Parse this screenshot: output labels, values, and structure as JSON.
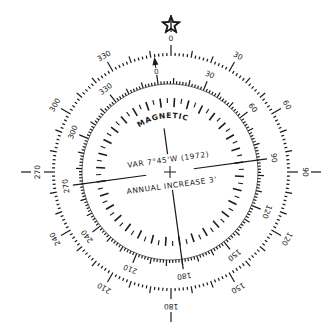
{
  "figure": {
    "colors": {
      "ink": "#1a1a1a",
      "background": "#ffffff"
    }
  },
  "true_ring": {
    "label": "True",
    "north_symbol": "star-icon",
    "center": [
      171,
      172
    ],
    "radius": 116,
    "labels": [
      "0",
      "30",
      "60",
      "90",
      "120",
      "150",
      "180",
      "210",
      "240",
      "270",
      "300",
      "330"
    ],
    "label_degrees": [
      0,
      30,
      60,
      90,
      120,
      150,
      180,
      210,
      240,
      270,
      300,
      330
    ]
  },
  "magnetic_ring": {
    "title": "MAGNETIC",
    "north_symbol": "arrow-up-icon",
    "center": [
      170,
      172
    ],
    "radius": 88,
    "rotation_deg": -7.75,
    "labels": [
      "0",
      "30",
      "60",
      "90",
      "120",
      "150",
      "180",
      "210",
      "240",
      "270",
      "300",
      "330"
    ],
    "label_degrees": [
      0,
      30,
      60,
      90,
      120,
      150,
      180,
      210,
      240,
      270,
      300,
      330
    ]
  },
  "center_text": {
    "variation": "VAR 7°45'W (1972)",
    "annual_change": "ANNUAL INCREASE 3'"
  }
}
